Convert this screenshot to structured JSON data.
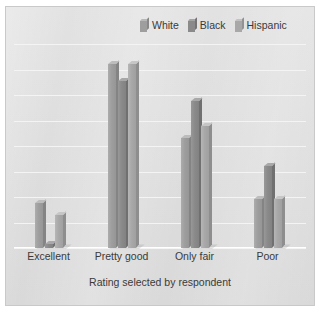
{
  "chart_data": {
    "type": "bar",
    "title": "",
    "subtitle": "",
    "xlabel": "Rating selected by respondent",
    "ylabel": "",
    "categories": [
      "Excellent",
      "Pretty good",
      "Only fair",
      "Poor"
    ],
    "series": [
      {
        "name": "White",
        "color": "#9e9e9e",
        "values": [
          11,
          45,
          27,
          12
        ]
      },
      {
        "name": "Black",
        "color": "#8a8a8a",
        "values": [
          1,
          41,
          36,
          20
        ]
      },
      {
        "name": "Hispanic",
        "color": "#a8a8a8",
        "values": [
          8,
          45,
          30,
          12
        ]
      }
    ],
    "ylim": [
      0,
      50
    ],
    "gridlines": 8,
    "grid": true,
    "legend_position": "top-right",
    "y_tick_labels": [],
    "style": "3d-bars-grayscale"
  },
  "legend": {
    "items": [
      {
        "label": "White"
      },
      {
        "label": "Black"
      },
      {
        "label": "Hispanic"
      }
    ]
  },
  "colors": {
    "plot_background": "#dcdcdc",
    "gridline": "#f4f4f4",
    "text": "#3a3a3a",
    "white_series": "#9e9e9e",
    "black_series": "#8a8a8a",
    "hispanic_series": "#a8a8a8"
  }
}
